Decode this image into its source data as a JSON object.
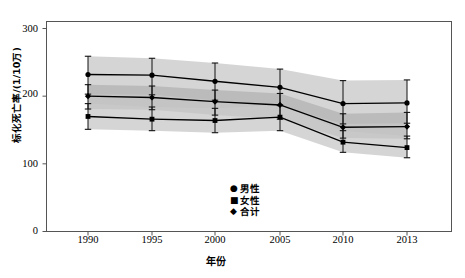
{
  "chart_data": {
    "type": "line",
    "title": "",
    "xlabel": "年份",
    "ylabel": "标化死亡率/(1/10万)",
    "categories": [
      "1990",
      "1995",
      "2000",
      "2005",
      "2010",
      "2013"
    ],
    "x": [
      1990,
      1995,
      2000,
      2005,
      2010,
      2013
    ],
    "xlim": [
      1987,
      1916
    ],
    "ylim": [
      0,
      300
    ],
    "yticks": [
      "0",
      "100",
      "200",
      "300"
    ],
    "ytick_values": [
      0,
      100,
      200,
      300
    ],
    "grid": false,
    "legend_position": "bottom-center-inside",
    "series": [
      {
        "name": "男性",
        "marker": "circle",
        "values": [
          232,
          231,
          222,
          213,
          189,
          190
        ],
        "err_low": [
          203,
          202,
          194,
          186,
          159,
          160
        ],
        "err_high": [
          259,
          256,
          249,
          240,
          223,
          224
        ]
      },
      {
        "name": "合计",
        "marker": "diamond",
        "values": [
          200,
          198,
          192,
          187,
          154,
          155
        ],
        "err_low": [
          181,
          180,
          172,
          166,
          138,
          137
        ],
        "err_high": [
          217,
          215,
          209,
          204,
          174,
          176
        ]
      },
      {
        "name": "女性",
        "marker": "square",
        "values": [
          170,
          166,
          164,
          169,
          132,
          124
        ],
        "err_low": [
          151,
          149,
          146,
          149,
          117,
          109
        ],
        "err_high": [
          189,
          184,
          182,
          187,
          149,
          141
        ]
      }
    ],
    "bands": [
      {
        "name": "男性区间",
        "upper": [
          259,
          256,
          249,
          240,
          223,
          224
        ],
        "lower": [
          203,
          202,
          194,
          186,
          159,
          160
        ],
        "color": "#c9c9c9"
      },
      {
        "name": "合计区间",
        "upper": [
          217,
          215,
          209,
          204,
          174,
          176
        ],
        "lower": [
          181,
          180,
          172,
          166,
          138,
          137
        ],
        "color": "#b4b4b4"
      },
      {
        "name": "女性区间",
        "upper": [
          189,
          184,
          182,
          187,
          149,
          141
        ],
        "lower": [
          151,
          149,
          146,
          149,
          117,
          109
        ],
        "color": "#c9c9c9"
      }
    ],
    "colors": {
      "line": "#000000",
      "marker": "#000000",
      "band_outer": "#c9c9c9",
      "band_inner": "#b4b4b4",
      "axis": "#555555",
      "background": "#ffffff"
    }
  },
  "legend": {
    "items": [
      {
        "marker_glyph": "●",
        "label": "男性"
      },
      {
        "marker_glyph": "■",
        "label": "女性"
      },
      {
        "marker_glyph": "◆",
        "label": "合计"
      }
    ]
  },
  "axis": {
    "y_label": "标化死亡率/(1/10万)",
    "x_label": "年份",
    "y_ticks": [
      "300",
      "200",
      "100",
      "0"
    ],
    "x_ticks": [
      "1990",
      "1995",
      "2000",
      "2005",
      "2010",
      "2013"
    ]
  }
}
